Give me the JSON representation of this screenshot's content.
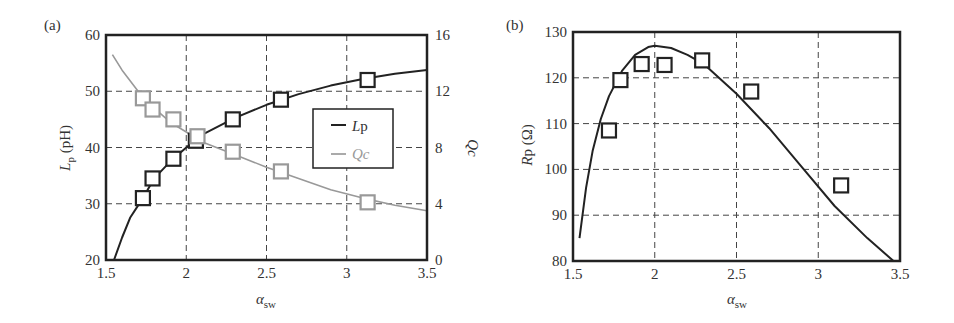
{
  "chart_data": [
    {
      "panel": "(a)",
      "type": "line",
      "title": "",
      "xlabel": "α_sw",
      "ylabel": "L_p (pH)",
      "y2label": "Qc",
      "xlim": [
        1.5,
        3.5
      ],
      "ylim": [
        20,
        60
      ],
      "y2lim": [
        0,
        16
      ],
      "xticks": [
        "1.5",
        "2",
        "2.5",
        "3",
        "3.5"
      ],
      "yticks": [
        "20",
        "30",
        "40",
        "50",
        "60"
      ],
      "y2ticks": [
        "0",
        "4",
        "8",
        "12",
        "16"
      ],
      "grid": true,
      "legend": {
        "position": "center-right",
        "entries": [
          "Lp",
          "Qc"
        ]
      },
      "series": [
        {
          "name": "Lp",
          "axis": "left",
          "color": "#222222",
          "markers": {
            "x": [
              1.73,
              1.79,
              1.92,
              2.06,
              2.29,
              2.59,
              3.13
            ],
            "y": [
              31,
              34.5,
              38,
              41.2,
              45,
              48.5,
              52
            ]
          },
          "curve": {
            "x": [
              1.55,
              1.6,
              1.65,
              1.73,
              1.8,
              1.9,
              2.0,
              2.1,
              2.3,
              2.5,
              2.7,
              2.9,
              3.1,
              3.3,
              3.5
            ],
            "y": [
              20,
              24,
              27.5,
              31,
              34.5,
              37.5,
              40,
              42.3,
              45.2,
              47.6,
              49.5,
              51,
              52.2,
              53.1,
              53.8
            ]
          }
        },
        {
          "name": "Qc",
          "axis": "right",
          "color": "#999999",
          "markers": {
            "x": [
              1.73,
              1.79,
              1.92,
              2.07,
              2.29,
              2.59,
              3.13
            ],
            "y": [
              11.5,
              10.7,
              10.0,
              8.8,
              7.7,
              6.3,
              4.1
            ]
          },
          "curve": {
            "x": [
              1.54,
              1.6,
              1.7,
              1.8,
              1.9,
              2.0,
              2.1,
              2.3,
              2.5,
              2.7,
              2.9,
              3.1,
              3.3,
              3.5
            ],
            "y": [
              14.6,
              13.5,
              12.0,
              10.8,
              9.8,
              9.1,
              8.4,
              7.5,
              6.6,
              5.8,
              5.0,
              4.4,
              3.9,
              3.5
            ]
          }
        }
      ]
    },
    {
      "panel": "(b)",
      "type": "line",
      "title": "",
      "xlabel": "α_sw",
      "ylabel": "Rp (Ω)",
      "xlim": [
        1.5,
        3.5
      ],
      "ylim": [
        80,
        130
      ],
      "xticks": [
        "1.5",
        "2",
        "2.5",
        "3",
        "3.5"
      ],
      "yticks": [
        "80",
        "90",
        "100",
        "110",
        "120",
        "130"
      ],
      "grid": true,
      "series": [
        {
          "name": "Rp",
          "color": "#222222",
          "markers": {
            "x": [
              1.72,
              1.79,
              1.92,
              2.06,
              2.29,
              2.59,
              3.14
            ],
            "y": [
              108.5,
              119.5,
              123,
              122.8,
              123.8,
              117,
              96.5
            ]
          },
          "curve": {
            "x": [
              1.54,
              1.58,
              1.62,
              1.67,
              1.72,
              1.8,
              1.88,
              1.96,
              2.0,
              2.1,
              2.2,
              2.3,
              2.5,
              2.7,
              2.9,
              3.1,
              3.3,
              3.46
            ],
            "y": [
              85,
              96,
              104,
              111,
              116,
              121.5,
              125,
              126.7,
              127,
              126.5,
              125,
              123,
              116.5,
              109,
              100.5,
              92,
              85,
              80
            ]
          }
        }
      ]
    }
  ],
  "panels": {
    "a": {
      "tag": "(a)",
      "ylabel_main": "L",
      "ylabel_sub": "p",
      "ylabel_unit": " (pH)",
      "y2label": "Qc",
      "xlabel_main": "α",
      "xlabel_sub": "sw",
      "legend": {
        "lp_main": "L",
        "lp_sub": "p",
        "qc": "Qc"
      }
    },
    "b": {
      "tag": "(b)",
      "ylabel_main": "R",
      "ylabel_sub": "p",
      "ylabel_unit": " (Ω)",
      "xlabel_main": "α",
      "xlabel_sub": "sw"
    }
  }
}
